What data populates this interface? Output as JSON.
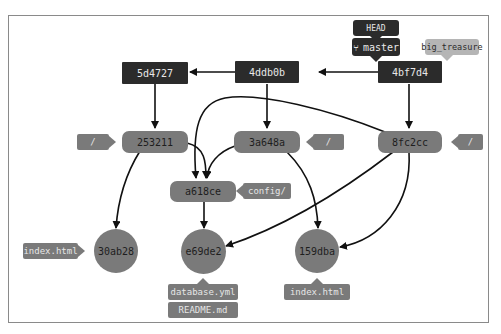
{
  "diagram": {
    "refs": {
      "head": "HEAD",
      "branch": "master",
      "branch_icon": "git-branch-icon",
      "tag": "big_treasure"
    },
    "commits": [
      {
        "id": "4bf7d4"
      },
      {
        "id": "4ddb0b"
      },
      {
        "id": "5d4727"
      }
    ],
    "trees": [
      {
        "id": "253211",
        "label": "/"
      },
      {
        "id": "3a648a",
        "label": "/"
      },
      {
        "id": "8fc2cc",
        "label": "/"
      },
      {
        "id": "a618ce",
        "label": "config/"
      }
    ],
    "blobs": [
      {
        "id": "30ab28",
        "labels": [
          "index.html"
        ]
      },
      {
        "id": "e69de2",
        "labels": [
          "database.yml",
          "README.md"
        ]
      },
      {
        "id": "159dba",
        "labels": [
          "index.html"
        ]
      }
    ],
    "edges": [
      [
        "4bf7d4",
        "4ddb0b"
      ],
      [
        "4ddb0b",
        "5d4727"
      ],
      [
        "5d4727",
        "253211"
      ],
      [
        "4ddb0b",
        "3a648a"
      ],
      [
        "4bf7d4",
        "8fc2cc"
      ],
      [
        "253211",
        "a618ce"
      ],
      [
        "3a648a",
        "a618ce"
      ],
      [
        "8fc2cc",
        "a618ce"
      ],
      [
        "253211",
        "30ab28"
      ],
      [
        "a618ce",
        "e69de2"
      ],
      [
        "8fc2cc",
        "e69de2"
      ],
      [
        "3a648a",
        "159dba"
      ],
      [
        "8fc2cc",
        "159dba"
      ]
    ],
    "colors": {
      "commit": "#2b2b2b",
      "tree": "#7a7a7a",
      "blob": "#7a7a7a",
      "tag": "#b5b5b5",
      "edge": "#111111"
    }
  }
}
